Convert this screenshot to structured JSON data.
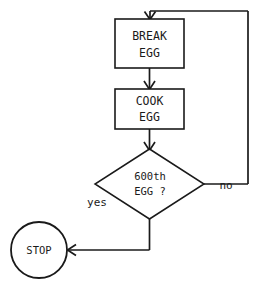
{
  "diagram": {
    "type": "flowchart",
    "title": "",
    "background_color": "#ffffff",
    "line_color": "#1a1a1a",
    "nodes": [
      {
        "id": "break-egg",
        "shape": "rectangle",
        "line1": "BREAK",
        "line2": "EGG"
      },
      {
        "id": "cook-egg",
        "shape": "rectangle",
        "line1": "COOK",
        "line2": "EGG"
      },
      {
        "id": "decision-600th-egg",
        "shape": "diamond",
        "line1": "600th",
        "line2": "EGG ?"
      },
      {
        "id": "stop",
        "shape": "circle",
        "line1": "STOP"
      }
    ],
    "edge_labels": {
      "yes": "yes",
      "no": "no"
    }
  }
}
